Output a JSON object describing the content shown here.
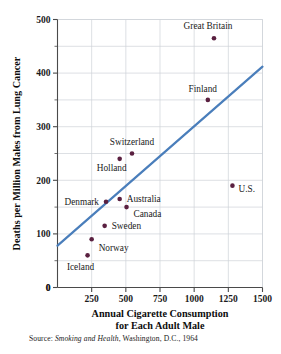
{
  "chart_data": {
    "type": "scatter",
    "title": "",
    "xlabel": "Annual Cigarette Consumption for Each Adult Male",
    "ylabel": "Deaths per Million Males from Lung Cancer",
    "xlim": [
      0,
      1500
    ],
    "ylim": [
      0,
      500
    ],
    "xticks": [
      0,
      250,
      500,
      750,
      1000,
      1250,
      1500
    ],
    "xtick_labels": [
      "0",
      "250",
      "500",
      "750",
      "1000",
      "1250",
      "1500"
    ],
    "yticks": [
      0,
      100,
      200,
      300,
      400,
      500
    ],
    "ytick_labels": [
      "0",
      "100",
      "200",
      "300",
      "400",
      "500"
    ],
    "y_minor_ticks": [
      50,
      150,
      250,
      350,
      450
    ],
    "grid": true,
    "grid_color": "#cfd3d8",
    "point_color": "#5a2040",
    "line_color": "#4a7ebb",
    "points": [
      {
        "label": "Great Britain",
        "x": 1145,
        "y": 465,
        "label_dx": -6,
        "label_dy": -9,
        "anchor": "middle"
      },
      {
        "label": "Finland",
        "x": 1100,
        "y": 350,
        "label_dx": -5,
        "label_dy": -8,
        "anchor": "middle"
      },
      {
        "label": "Switzerland",
        "x": 545,
        "y": 250,
        "label_dx": 0,
        "label_dy": -9,
        "anchor": "middle"
      },
      {
        "label": "Holland",
        "x": 455,
        "y": 240,
        "label_dx": -8,
        "label_dy": 12,
        "anchor": "middle"
      },
      {
        "label": "U.S.",
        "x": 1280,
        "y": 190,
        "label_dx": 6,
        "label_dy": 6,
        "anchor": "start"
      },
      {
        "label": "Denmark",
        "x": 355,
        "y": 160,
        "label_dx": -7,
        "label_dy": 3,
        "anchor": "end"
      },
      {
        "label": "Australia",
        "x": 455,
        "y": 165,
        "label_dx": 7,
        "label_dy": 3,
        "anchor": "start"
      },
      {
        "label": "Canada",
        "x": 505,
        "y": 150,
        "label_dx": 7,
        "label_dy": 10,
        "anchor": "start"
      },
      {
        "label": "Sweden",
        "x": 345,
        "y": 115,
        "label_dx": 7,
        "label_dy": 3,
        "anchor": "start"
      },
      {
        "label": "Norway",
        "x": 250,
        "y": 90,
        "label_dx": 7,
        "label_dy": 12,
        "anchor": "start"
      },
      {
        "label": "Iceland",
        "x": 220,
        "y": 60,
        "label_dx": -7,
        "label_dy": 15,
        "anchor": "middle"
      }
    ],
    "trend_line": {
      "x0": 0,
      "y0": 78,
      "x1": 1500,
      "y1": 412
    }
  },
  "source": {
    "prefix": "Source: ",
    "italic_title": "Smoking and Health",
    "suffix": ", Washington, D.C., 1964"
  }
}
